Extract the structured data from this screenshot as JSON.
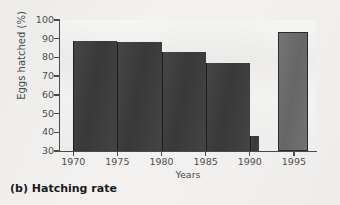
{
  "figure": {
    "caption": "(b) Hatching rate"
  },
  "chart_data": {
    "type": "bar",
    "title": "",
    "subtitle": "",
    "xlabel": "Years",
    "ylabel": "Eggs hatched (%)",
    "xlim": [
      1968.5,
      1997.5
    ],
    "ylim": [
      30,
      100
    ],
    "ytick_labels": [
      "100",
      "90",
      "80",
      "70",
      "60",
      "50",
      "40",
      "30"
    ],
    "ytick_values": [
      100,
      90,
      80,
      70,
      60,
      50,
      40,
      30
    ],
    "xtick_labels": [
      "1970",
      "1975",
      "1980",
      "1985",
      "1990",
      "1995"
    ],
    "xtick_values": [
      1970,
      1975,
      1980,
      1985,
      1990,
      1995
    ],
    "grid": false,
    "legend": "none",
    "baseline": 30,
    "bar_style": "histogram-adjacent",
    "colors": {
      "bar_dark": "#3c3c3c",
      "bar_light": "#6b6b6b",
      "bar_light_edge": "#2a2a2a",
      "axis": "#4a4a4a",
      "plot_background": "#ebeae8",
      "page_background": "#f2f1ef",
      "text": "#4e4e4e",
      "caption_text": "#1a1a1a"
    },
    "bars": [
      {
        "label": "1970-1975",
        "x_start": 1970,
        "x_end": 1975,
        "value": 89,
        "shade": "dark"
      },
      {
        "label": "1975-1980",
        "x_start": 1975,
        "x_end": 1980,
        "value": 88,
        "shade": "dark"
      },
      {
        "label": "1980-1985",
        "x_start": 1980,
        "x_end": 1985,
        "value": 83,
        "shade": "dark"
      },
      {
        "label": "1985-1990",
        "x_start": 1985,
        "x_end": 1990,
        "value": 77,
        "shade": "dark"
      },
      {
        "label": "1990",
        "x_start": 1990,
        "x_end": 1991,
        "value": 38,
        "shade": "dark"
      },
      {
        "label": "1995",
        "x_start": 1993.2,
        "x_end": 1996.6,
        "value": 93.5,
        "shade": "light"
      }
    ],
    "categories": [
      "1970-1975",
      "1975-1980",
      "1980-1985",
      "1985-1990",
      "1990",
      "1995"
    ],
    "values": [
      89,
      88,
      83,
      77,
      38,
      93.5
    ]
  }
}
